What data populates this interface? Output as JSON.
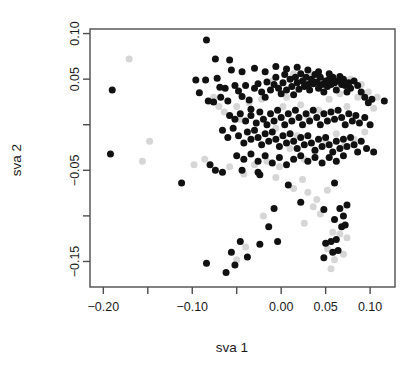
{
  "chart_data": {
    "type": "scatter",
    "title": "",
    "xlabel": "sva 1",
    "ylabel": "sva 2",
    "xlim": [
      -0.215,
      0.128
    ],
    "ylim": [
      -0.178,
      0.105
    ],
    "grid": false,
    "legend": "none",
    "xticks": [
      -0.2,
      -0.15,
      -0.1,
      -0.05,
      0.0,
      0.05,
      0.1
    ],
    "xtick_labels": [
      "-0.20",
      "",
      "-0.10",
      "",
      "0.00",
      "0.05",
      "0.10"
    ],
    "yticks": [
      0.1,
      0.05,
      0.0,
      -0.05,
      -0.1,
      -0.15
    ],
    "ytick_labels": [
      "0.10",
      "0.05",
      "",
      "-0.05",
      "",
      "-0.15"
    ],
    "point_radius": 3.5,
    "series": [
      {
        "name": "black-group",
        "color": "#111111",
        "points": [
          [
            -0.19,
            0.038
          ],
          [
            -0.192,
            -0.032
          ],
          [
            -0.084,
            0.093
          ],
          [
            -0.074,
            0.072
          ],
          [
            -0.058,
            0.071
          ],
          [
            -0.096,
            0.049
          ],
          [
            -0.085,
            0.049
          ],
          [
            -0.072,
            0.051
          ],
          [
            -0.092,
            0.035
          ],
          [
            -0.069,
            0.041
          ],
          [
            -0.063,
            0.04
          ],
          [
            -0.082,
            0.026
          ],
          [
            -0.076,
            0.025
          ],
          [
            -0.068,
            0.03
          ],
          [
            -0.06,
            0.026
          ],
          [
            -0.052,
            0.043
          ],
          [
            -0.048,
            0.037
          ],
          [
            -0.044,
            0.031
          ],
          [
            -0.04,
            0.043
          ],
          [
            -0.036,
            0.027
          ],
          [
            -0.034,
            0.017
          ],
          [
            -0.03,
            0.04
          ],
          [
            -0.026,
            0.045
          ],
          [
            -0.022,
            0.036
          ],
          [
            -0.018,
            0.03
          ],
          [
            -0.016,
            0.047
          ],
          [
            -0.012,
            0.038
          ],
          [
            -0.008,
            0.044
          ],
          [
            -0.006,
            0.052
          ],
          [
            -0.003,
            0.04
          ],
          [
            0.0,
            0.034
          ],
          [
            0.002,
            0.046
          ],
          [
            0.004,
            0.055
          ],
          [
            0.006,
            0.038
          ],
          [
            0.01,
            0.05
          ],
          [
            0.012,
            0.042
          ],
          [
            0.014,
            0.033
          ],
          [
            0.016,
            0.052
          ],
          [
            0.018,
            0.046
          ],
          [
            0.02,
            0.039
          ],
          [
            0.022,
            0.056
          ],
          [
            0.024,
            0.048
          ],
          [
            0.026,
            0.042
          ],
          [
            0.028,
            0.052
          ],
          [
            0.03,
            0.044
          ],
          [
            0.032,
            0.038
          ],
          [
            0.034,
            0.05
          ],
          [
            0.036,
            0.045
          ],
          [
            0.038,
            0.055
          ],
          [
            0.04,
            0.047
          ],
          [
            0.042,
            0.04
          ],
          [
            0.044,
            0.052
          ],
          [
            0.046,
            0.044
          ],
          [
            0.048,
            0.036
          ],
          [
            0.05,
            0.048
          ],
          [
            0.052,
            0.042
          ],
          [
            0.054,
            0.05
          ],
          [
            0.056,
            0.044
          ],
          [
            0.058,
            0.052
          ],
          [
            0.06,
            0.046
          ],
          [
            0.062,
            0.038
          ],
          [
            0.064,
            0.048
          ],
          [
            0.066,
            0.053
          ],
          [
            0.068,
            0.044
          ],
          [
            0.07,
            0.05
          ],
          [
            0.072,
            0.043
          ],
          [
            0.074,
            0.036
          ],
          [
            0.076,
            0.046
          ],
          [
            0.078,
            0.04
          ],
          [
            0.082,
            0.048
          ],
          [
            0.086,
            0.043
          ],
          [
            0.09,
            0.036
          ],
          [
            0.094,
            0.03
          ],
          [
            0.098,
            0.024
          ],
          [
            0.102,
            0.028
          ],
          [
            0.116,
            0.026
          ],
          [
            -0.056,
            0.06
          ],
          [
            -0.044,
            0.058
          ],
          [
            -0.03,
            0.062
          ],
          [
            -0.018,
            0.058
          ],
          [
            -0.006,
            0.064
          ],
          [
            0.006,
            0.061
          ],
          [
            0.018,
            0.063
          ],
          [
            0.03,
            0.06
          ],
          [
            0.042,
            0.058
          ],
          [
            0.054,
            0.056
          ],
          [
            -0.058,
            0.01
          ],
          [
            -0.052,
            0.006
          ],
          [
            -0.046,
            0.012
          ],
          [
            -0.04,
            0.004
          ],
          [
            -0.034,
            0.01
          ],
          [
            -0.028,
            0.002
          ],
          [
            -0.024,
            0.014
          ],
          [
            -0.02,
            0.006
          ],
          [
            -0.016,
            0.0
          ],
          [
            -0.012,
            0.012
          ],
          [
            -0.008,
            0.004
          ],
          [
            -0.004,
            0.016
          ],
          [
            0.0,
            0.008
          ],
          [
            0.004,
            0.0
          ],
          [
            0.008,
            0.012
          ],
          [
            0.012,
            0.004
          ],
          [
            0.016,
            0.016
          ],
          [
            0.02,
            0.008
          ],
          [
            0.024,
            0.0
          ],
          [
            0.028,
            0.012
          ],
          [
            0.032,
            0.004
          ],
          [
            0.036,
            0.016
          ],
          [
            0.04,
            0.008
          ],
          [
            0.044,
            0.0
          ],
          [
            0.048,
            0.012
          ],
          [
            0.052,
            0.004
          ],
          [
            0.056,
            0.014
          ],
          [
            0.06,
            0.006
          ],
          [
            0.064,
            0.016
          ],
          [
            0.068,
            0.008
          ],
          [
            0.072,
            0.0
          ],
          [
            0.076,
            0.012
          ],
          [
            0.08,
            0.004
          ],
          [
            0.084,
            0.01
          ],
          [
            0.088,
            0.002
          ],
          [
            0.094,
            0.008
          ],
          [
            0.1,
            0.0
          ],
          [
            -0.066,
            -0.006
          ],
          [
            -0.06,
            -0.014
          ],
          [
            -0.054,
            -0.004
          ],
          [
            -0.048,
            -0.012
          ],
          [
            -0.042,
            -0.02
          ],
          [
            -0.038,
            -0.008
          ],
          [
            -0.034,
            -0.016
          ],
          [
            -0.03,
            -0.006
          ],
          [
            -0.026,
            -0.014
          ],
          [
            -0.022,
            -0.022
          ],
          [
            -0.018,
            -0.01
          ],
          [
            -0.014,
            -0.018
          ],
          [
            -0.01,
            -0.008
          ],
          [
            -0.006,
            -0.016
          ],
          [
            -0.002,
            -0.024
          ],
          [
            0.002,
            -0.012
          ],
          [
            0.006,
            -0.02
          ],
          [
            0.01,
            -0.01
          ],
          [
            0.014,
            -0.018
          ],
          [
            0.018,
            -0.026
          ],
          [
            0.022,
            -0.014
          ],
          [
            0.026,
            -0.022
          ],
          [
            0.03,
            -0.012
          ],
          [
            0.034,
            -0.02
          ],
          [
            0.038,
            -0.028
          ],
          [
            0.042,
            -0.016
          ],
          [
            0.046,
            -0.024
          ],
          [
            0.05,
            -0.014
          ],
          [
            0.054,
            -0.022
          ],
          [
            0.058,
            -0.03
          ],
          [
            0.062,
            -0.018
          ],
          [
            0.066,
            -0.026
          ],
          [
            0.07,
            -0.016
          ],
          [
            0.074,
            -0.024
          ],
          [
            0.078,
            -0.014
          ],
          [
            0.082,
            -0.022
          ],
          [
            0.086,
            -0.03
          ],
          [
            0.09,
            -0.018
          ],
          [
            0.096,
            -0.026
          ],
          [
            0.104,
            -0.03
          ],
          [
            -0.05,
            -0.034
          ],
          [
            -0.042,
            -0.038
          ],
          [
            -0.034,
            -0.032
          ],
          [
            -0.026,
            -0.04
          ],
          [
            -0.018,
            -0.034
          ],
          [
            -0.01,
            -0.042
          ],
          [
            -0.002,
            -0.036
          ],
          [
            0.006,
            -0.044
          ],
          [
            0.014,
            -0.038
          ],
          [
            0.022,
            -0.034
          ],
          [
            0.03,
            -0.04
          ],
          [
            0.038,
            -0.036
          ],
          [
            0.046,
            -0.042
          ],
          [
            0.054,
            -0.036
          ],
          [
            0.062,
            -0.04
          ],
          [
            0.07,
            -0.034
          ],
          [
            -0.08,
            -0.044
          ],
          [
            -0.074,
            -0.05
          ],
          [
            -0.066,
            -0.052
          ],
          [
            -0.044,
            -0.05
          ],
          [
            -0.026,
            -0.052
          ],
          [
            -0.024,
            -0.055
          ],
          [
            -0.112,
            -0.064
          ],
          [
            0.008,
            -0.066
          ],
          [
            0.06,
            -0.064
          ],
          [
            -0.008,
            -0.092
          ],
          [
            0.022,
            -0.085
          ],
          [
            0.048,
            -0.093
          ],
          [
            0.066,
            -0.092
          ],
          [
            0.074,
            -0.088
          ],
          [
            0.06,
            -0.104
          ],
          [
            0.07,
            -0.1
          ],
          [
            -0.014,
            -0.112
          ],
          [
            0.068,
            -0.112
          ],
          [
            0.072,
            -0.11
          ],
          [
            -0.046,
            -0.128
          ],
          [
            -0.024,
            -0.131
          ],
          [
            -0.004,
            -0.128
          ],
          [
            0.05,
            -0.13
          ],
          [
            0.056,
            -0.128
          ],
          [
            0.062,
            -0.126
          ],
          [
            0.058,
            -0.14
          ],
          [
            0.064,
            -0.138
          ],
          [
            -0.056,
            -0.14
          ],
          [
            -0.038,
            -0.145
          ],
          [
            0.048,
            -0.146
          ],
          [
            -0.084,
            -0.152
          ],
          [
            -0.052,
            -0.154
          ],
          [
            -0.062,
            -0.162
          ]
        ]
      },
      {
        "name": "gray-group",
        "color": "#d6d6d6",
        "points": [
          [
            -0.171,
            0.072
          ],
          [
            -0.148,
            -0.018
          ],
          [
            -0.156,
            -0.04
          ],
          [
            -0.098,
            -0.044
          ],
          [
            -0.086,
            -0.038
          ],
          [
            -0.076,
            0.03
          ],
          [
            -0.07,
            0.02
          ],
          [
            -0.064,
            0.014
          ],
          [
            -0.058,
            -0.046
          ],
          [
            -0.05,
            0.02
          ],
          [
            -0.046,
            0.006
          ],
          [
            -0.042,
            -0.054
          ],
          [
            -0.036,
            0.024
          ],
          [
            -0.03,
            -0.044
          ],
          [
            -0.022,
            0.028
          ],
          [
            -0.016,
            -0.04
          ],
          [
            -0.01,
            0.048
          ],
          [
            -0.006,
            -0.004
          ],
          [
            -0.002,
            -0.046
          ],
          [
            0.002,
            0.02
          ],
          [
            0.006,
            0.03
          ],
          [
            0.01,
            -0.026
          ],
          [
            0.014,
            0.056
          ],
          [
            0.018,
            -0.012
          ],
          [
            0.022,
            0.022
          ],
          [
            0.026,
            -0.038
          ],
          [
            0.03,
            0.008
          ],
          [
            0.034,
            0.056
          ],
          [
            0.038,
            -0.03
          ],
          [
            0.042,
            0.016
          ],
          [
            0.046,
            0.046
          ],
          [
            0.05,
            -0.018
          ],
          [
            0.054,
            0.028
          ],
          [
            0.058,
            0.052
          ],
          [
            0.062,
            -0.01
          ],
          [
            0.066,
            0.034
          ],
          [
            0.07,
            -0.024
          ],
          [
            0.074,
            0.02
          ],
          [
            0.078,
            0.05
          ],
          [
            0.082,
            -0.016
          ],
          [
            0.086,
            0.03
          ],
          [
            0.09,
            0.044
          ],
          [
            0.094,
            -0.008
          ],
          [
            0.098,
            0.036
          ],
          [
            0.104,
            0.018
          ],
          [
            0.108,
            0.03
          ],
          [
            -0.006,
            -0.058
          ],
          [
            0.024,
            -0.06
          ],
          [
            0.014,
            -0.07
          ],
          [
            0.03,
            -0.074
          ],
          [
            0.04,
            -0.082
          ],
          [
            0.036,
            -0.09
          ],
          [
            0.044,
            -0.098
          ],
          [
            0.052,
            -0.072
          ],
          [
            -0.02,
            -0.1
          ],
          [
            0.026,
            -0.108
          ],
          [
            0.058,
            -0.118
          ],
          [
            0.066,
            -0.12
          ],
          [
            0.074,
            -0.124
          ],
          [
            0.052,
            -0.136
          ],
          [
            0.06,
            -0.148
          ],
          [
            0.07,
            -0.142
          ],
          [
            -0.04,
            -0.134
          ],
          [
            -0.05,
            -0.148
          ],
          [
            0.056,
            -0.158
          ]
        ]
      }
    ]
  },
  "axes": {
    "x_title": "sva 1",
    "y_title": "sva 2"
  }
}
